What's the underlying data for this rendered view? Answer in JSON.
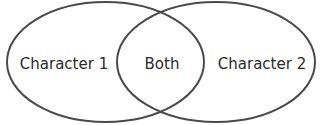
{
  "diagram": {
    "type": "venn",
    "sets": [
      {
        "id": "left",
        "label": "Character 1"
      },
      {
        "id": "right",
        "label": "Character 2"
      }
    ],
    "intersection": {
      "label": "Both"
    },
    "colors": {
      "stroke": "#4a4a4a",
      "text": "#2b2b2b",
      "background": "#ffffff"
    }
  }
}
